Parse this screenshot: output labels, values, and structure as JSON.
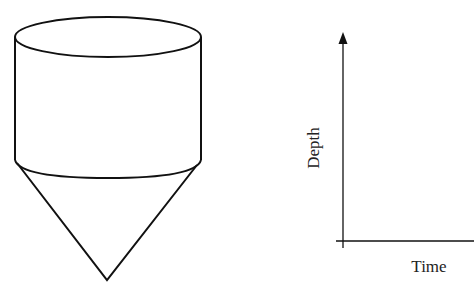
{
  "diagram": {
    "tank": {
      "shape": "cylinder-with-conical-bottom",
      "stroke_color": "#111111"
    },
    "graph": {
      "x_axis_label": "Time",
      "y_axis_label": "Depth",
      "axis_color": "#111111",
      "data": []
    }
  }
}
